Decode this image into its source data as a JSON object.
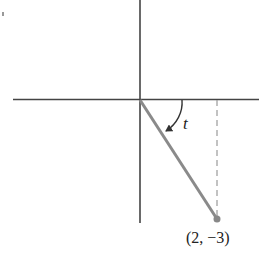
{
  "figure": {
    "type": "unit-angle diagram",
    "angle_label": "t",
    "point_label": "(2, −3)",
    "point": {
      "x": 2,
      "y": -3
    },
    "colors": {
      "axes": "#444444",
      "terminal_side": "#8a8a8a",
      "dashed_projection": "#9a9a9a",
      "arc": "#333333",
      "text": "#222222"
    }
  }
}
